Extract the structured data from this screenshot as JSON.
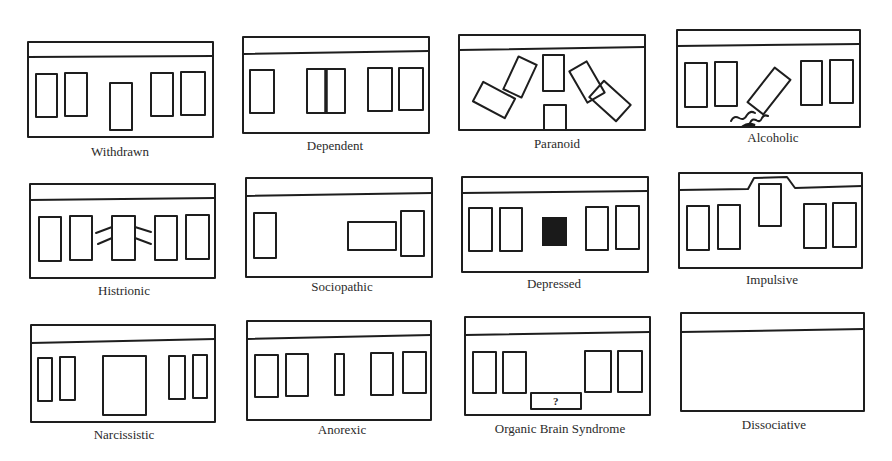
{
  "figure": {
    "panels": [
      {
        "id": "withdrawn",
        "label": "Withdrawn",
        "row": 1,
        "col": 1
      },
      {
        "id": "dependent",
        "label": "Dependent",
        "row": 1,
        "col": 2
      },
      {
        "id": "paranoid",
        "label": "Paranoid",
        "row": 1,
        "col": 3
      },
      {
        "id": "alcoholic",
        "label": "Alcoholic",
        "row": 1,
        "col": 4
      },
      {
        "id": "histrionic",
        "label": "Histrionic",
        "row": 2,
        "col": 1
      },
      {
        "id": "sociopathic",
        "label": "Sociopathic",
        "row": 2,
        "col": 2
      },
      {
        "id": "depressed",
        "label": "Depressed",
        "row": 2,
        "col": 3
      },
      {
        "id": "impulsive",
        "label": "Impulsive",
        "row": 2,
        "col": 4
      },
      {
        "id": "narcissistic",
        "label": "Narcissistic",
        "row": 3,
        "col": 1
      },
      {
        "id": "anorexic",
        "label": "Anorexic",
        "row": 3,
        "col": 2
      },
      {
        "id": "organic-brain-syndrome",
        "label": "Organic Brain Syndrome",
        "row": 3,
        "col": 3,
        "annotation": "?"
      },
      {
        "id": "dissociative",
        "label": "Dissociative",
        "row": 3,
        "col": 4
      }
    ]
  }
}
